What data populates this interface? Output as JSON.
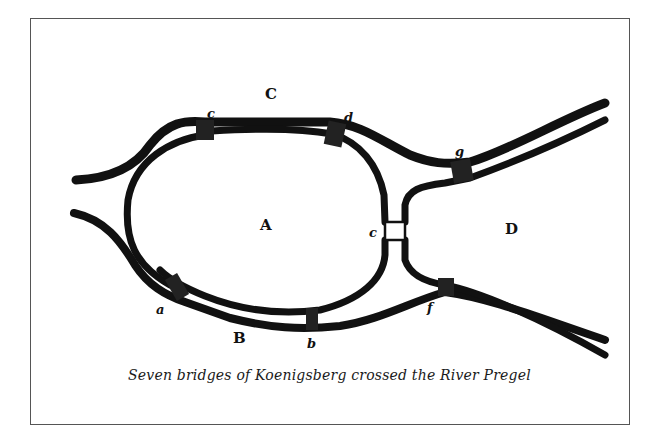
{
  "figure": {
    "caption": "Seven bridges of Koenigsberg crossed the River Pregel",
    "land_masses": [
      {
        "id": "A",
        "label": "A",
        "x": 267,
        "y": 230
      },
      {
        "id": "B",
        "label": "B",
        "x": 240,
        "y": 343
      },
      {
        "id": "C",
        "label": "C",
        "x": 272,
        "y": 98
      },
      {
        "id": "D",
        "label": "D",
        "x": 512,
        "y": 233
      }
    ],
    "bridges": [
      {
        "id": "a",
        "label": "a",
        "x": 160,
        "y": 314
      },
      {
        "id": "b",
        "label": "b",
        "x": 312,
        "y": 347
      },
      {
        "id": "c1",
        "label": "c",
        "x": 211,
        "y": 117
      },
      {
        "id": "d",
        "label": "d",
        "x": 349,
        "y": 121
      },
      {
        "id": "g",
        "label": "g",
        "x": 459,
        "y": 155
      },
      {
        "id": "e",
        "label": "c",
        "x": 374,
        "y": 236
      },
      {
        "id": "f",
        "label": "f",
        "x": 431,
        "y": 310
      }
    ],
    "ink_color": "#111111",
    "frame_color": "#555555"
  }
}
